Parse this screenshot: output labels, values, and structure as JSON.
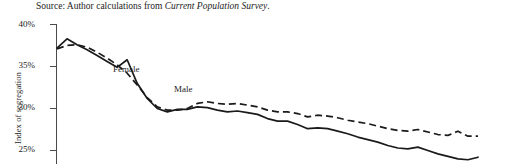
{
  "source_note": {
    "prefix": "Source: Author calculations from ",
    "italic_part": "Current Population Survey",
    "suffix": "."
  },
  "axis_title": "Index of segregation",
  "series_labels": {
    "female": "Female",
    "male": "Male"
  },
  "colors": {
    "line": "#1a1a1a",
    "axis": "#4a4a4a",
    "text": "#232323",
    "background": "#ffffff"
  },
  "chart_data": {
    "type": "line",
    "title": "",
    "xlabel": "",
    "ylabel": "Index of segregation",
    "ylim": [
      23.5,
      40
    ],
    "yticks": [
      40,
      35,
      30,
      25
    ],
    "ytick_labels": [
      "40%",
      "35%",
      "30%",
      "25%"
    ],
    "grid": false,
    "legend_position": "inline-annotation",
    "note": "Chart is cropped: bottom of plot area and x-axis are not visible in the screenshot; both series continue below the visible frame on the right.",
    "x": [
      1,
      2,
      3,
      4,
      5,
      6,
      7,
      8,
      9,
      10,
      11,
      12,
      13,
      14,
      15,
      16,
      17,
      18,
      19,
      20,
      21,
      22,
      23,
      24,
      25,
      26,
      27,
      28,
      29,
      30,
      31,
      32,
      33,
      34,
      35,
      36,
      37,
      38,
      39,
      40,
      41,
      42,
      43
    ],
    "series": [
      {
        "name": "Female",
        "style": "solid",
        "values": [
          37.2,
          38.3,
          37.6,
          37.0,
          36.3,
          35.6,
          34.9,
          35.8,
          33.0,
          31.2,
          30.0,
          29.6,
          29.9,
          29.9,
          30.2,
          30.1,
          29.8,
          29.6,
          29.7,
          29.5,
          29.3,
          28.8,
          28.5,
          28.5,
          28.1,
          27.6,
          27.7,
          27.6,
          27.3,
          27.0,
          26.6,
          26.3,
          26.0,
          25.6,
          25.3,
          25.2,
          25.4,
          25.0,
          24.6,
          24.3,
          24.0,
          23.9,
          24.2
        ]
      },
      {
        "name": "Male",
        "style": "dashed",
        "values": [
          37.1,
          37.5,
          37.6,
          37.3,
          36.7,
          36.0,
          35.2,
          34.2,
          32.8,
          31.3,
          30.2,
          29.8,
          29.8,
          30.0,
          30.6,
          30.8,
          30.6,
          30.5,
          30.6,
          30.4,
          30.2,
          29.8,
          29.6,
          29.6,
          29.4,
          29.0,
          29.2,
          29.1,
          28.9,
          28.6,
          28.4,
          28.2,
          27.9,
          27.6,
          27.4,
          27.3,
          27.5,
          27.2,
          26.9,
          26.8,
          27.3,
          26.7,
          26.7
        ]
      }
    ]
  }
}
